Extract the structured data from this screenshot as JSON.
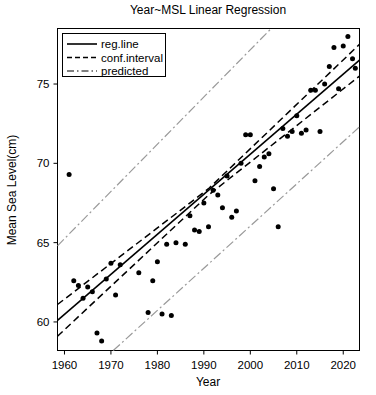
{
  "chart_data": {
    "type": "scatter",
    "title": "Year~MSL Linear Regression",
    "xlabel": "Year",
    "ylabel": "Mean Sea Level(cm)",
    "xlim": [
      1958.5,
      2023.5
    ],
    "ylim": [
      58.2,
      78.5
    ],
    "xticks": [
      1960,
      1970,
      1980,
      1990,
      2000,
      2010,
      2020
    ],
    "xtick_labels": [
      "1960",
      "1970",
      "1980",
      "1990",
      "2000",
      "2010",
      "2020"
    ],
    "yticks": [
      60,
      65,
      70,
      75
    ],
    "ytick_labels": [
      "60",
      "65",
      "70",
      "75"
    ],
    "grid": false,
    "legend_position": "top-left",
    "legend": [
      {
        "label": "reg.line",
        "style": "solid",
        "color": "#000000"
      },
      {
        "label": "conf.interval",
        "style": "dashed",
        "color": "#000000"
      },
      {
        "label": "predicted",
        "style": "dashdot",
        "color": "#9a9a9a"
      }
    ],
    "series": [
      {
        "name": "observations",
        "type": "scatter",
        "marker": "circle",
        "color": "#000000",
        "points": [
          {
            "x": 1961,
            "y": 69.3
          },
          {
            "x": 1962,
            "y": 62.6
          },
          {
            "x": 1963,
            "y": 62.3
          },
          {
            "x": 1964,
            "y": 61.5
          },
          {
            "x": 1965,
            "y": 62.2
          },
          {
            "x": 1966,
            "y": 61.9
          },
          {
            "x": 1967,
            "y": 59.3
          },
          {
            "x": 1968,
            "y": 58.8
          },
          {
            "x": 1969,
            "y": 62.7
          },
          {
            "x": 1970,
            "y": 63.7
          },
          {
            "x": 1971,
            "y": 61.7
          },
          {
            "x": 1972,
            "y": 63.6
          },
          {
            "x": 1976,
            "y": 63.1
          },
          {
            "x": 1978,
            "y": 60.6
          },
          {
            "x": 1979,
            "y": 62.6
          },
          {
            "x": 1980,
            "y": 63.8
          },
          {
            "x": 1981,
            "y": 60.5
          },
          {
            "x": 1982,
            "y": 64.9
          },
          {
            "x": 1983,
            "y": 60.4
          },
          {
            "x": 1984,
            "y": 65.0
          },
          {
            "x": 1986,
            "y": 64.9
          },
          {
            "x": 1987,
            "y": 66.7
          },
          {
            "x": 1988,
            "y": 65.8
          },
          {
            "x": 1989,
            "y": 65.7
          },
          {
            "x": 1990,
            "y": 67.5
          },
          {
            "x": 1991,
            "y": 66.0
          },
          {
            "x": 1992,
            "y": 68.3
          },
          {
            "x": 1993,
            "y": 68.0
          },
          {
            "x": 1994,
            "y": 67.2
          },
          {
            "x": 1995,
            "y": 69.2
          },
          {
            "x": 1996,
            "y": 66.6
          },
          {
            "x": 1997,
            "y": 67.0
          },
          {
            "x": 1998,
            "y": 70.0
          },
          {
            "x": 1999,
            "y": 71.8
          },
          {
            "x": 2000,
            "y": 71.8
          },
          {
            "x": 2001,
            "y": 68.9
          },
          {
            "x": 2002,
            "y": 69.8
          },
          {
            "x": 2003,
            "y": 70.4
          },
          {
            "x": 2004,
            "y": 70.6
          },
          {
            "x": 2005,
            "y": 68.4
          },
          {
            "x": 2006,
            "y": 66.0
          },
          {
            "x": 2007,
            "y": 72.2
          },
          {
            "x": 2008,
            "y": 71.7
          },
          {
            "x": 2009,
            "y": 72.0
          },
          {
            "x": 2010,
            "y": 73.0
          },
          {
            "x": 2011,
            "y": 71.9
          },
          {
            "x": 2012,
            "y": 72.1
          },
          {
            "x": 2013,
            "y": 74.6
          },
          {
            "x": 2014,
            "y": 74.6
          },
          {
            "x": 2015,
            "y": 72.0
          },
          {
            "x": 2016,
            "y": 75.0
          },
          {
            "x": 2017,
            "y": 76.1
          },
          {
            "x": 2018,
            "y": 77.3
          },
          {
            "x": 2019,
            "y": 74.7
          },
          {
            "x": 2020,
            "y": 77.4
          },
          {
            "x": 2021,
            "y": 78.0
          },
          {
            "x": 2022,
            "y": 76.6
          },
          {
            "x": 2022.6,
            "y": 76.0
          }
        ]
      },
      {
        "name": "reg.line",
        "type": "line",
        "style": "solid",
        "color": "#000000",
        "x": [
          1958.5,
          2023.5
        ],
        "y": [
          60.1,
          76.5
        ]
      },
      {
        "name": "conf.interval.upper",
        "type": "line",
        "style": "dashed",
        "color": "#000000",
        "x": [
          1958.5,
          1991,
          2023.5
        ],
        "y": [
          61.1,
          68.4,
          77.5
        ]
      },
      {
        "name": "conf.interval.lower",
        "type": "line",
        "style": "dashed",
        "color": "#000000",
        "x": [
          1958.5,
          1991,
          2023.5
        ],
        "y": [
          59.1,
          68.0,
          75.5
        ]
      },
      {
        "name": "predicted.upper",
        "type": "line",
        "style": "dashdot",
        "color": "#9a9a9a",
        "x": [
          1958.5,
          2004.5
        ],
        "y": [
          64.8,
          78.5
        ]
      },
      {
        "name": "predicted.lower",
        "type": "line",
        "style": "dashdot",
        "color": "#9a9a9a",
        "x": [
          1970.5,
          2023.5
        ],
        "y": [
          58.2,
          72.3
        ]
      }
    ]
  }
}
